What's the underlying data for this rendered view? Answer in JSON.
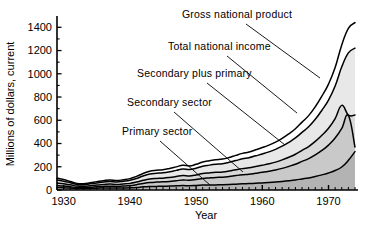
{
  "chart_data": {
    "type": "area",
    "title": "",
    "xlabel": "Year",
    "ylabel": "Millions of dollars, current",
    "xlim": [
      1929,
      1974
    ],
    "ylim": [
      0,
      1480
    ],
    "grid": false,
    "legend_position": "inline-annotations",
    "xticks": [
      "1930",
      "1940",
      "1950",
      "1960",
      "1970"
    ],
    "xtick_values": [
      1930,
      1940,
      1950,
      1960,
      1970
    ],
    "yticks": [
      "0",
      "200",
      "400",
      "600",
      "800",
      "1000",
      "1200",
      "1400"
    ],
    "ytick_values": [
      0,
      200,
      400,
      600,
      800,
      1000,
      1200,
      1400
    ],
    "x": [
      1929,
      1930,
      1931,
      1932,
      1933,
      1934,
      1935,
      1936,
      1937,
      1938,
      1939,
      1940,
      1941,
      1942,
      1943,
      1944,
      1945,
      1946,
      1947,
      1948,
      1949,
      1950,
      1951,
      1952,
      1953,
      1954,
      1955,
      1956,
      1957,
      1958,
      1959,
      1960,
      1961,
      1962,
      1963,
      1964,
      1965,
      1966,
      1967,
      1968,
      1969,
      1970,
      1971,
      1972,
      1973,
      1974
    ],
    "series": [
      {
        "name": "Primary sector",
        "fill": "#b3b3b3",
        "values": [
          22,
          20,
          17,
          13,
          12,
          14,
          16,
          17,
          18,
          17,
          18,
          19,
          22,
          27,
          30,
          31,
          32,
          34,
          36,
          38,
          37,
          39,
          42,
          43,
          44,
          45,
          47,
          50,
          53,
          55,
          58,
          61,
          64,
          68,
          73,
          79,
          86,
          95,
          104,
          116,
          130,
          146,
          168,
          198,
          255,
          330
        ]
      },
      {
        "name": "Secondary sector",
        "fill": "#c9c9c9",
        "values": [
          38,
          34,
          28,
          21,
          20,
          23,
          27,
          30,
          33,
          31,
          34,
          38,
          46,
          56,
          64,
          68,
          70,
          74,
          80,
          86,
          84,
          90,
          99,
          104,
          108,
          110,
          116,
          124,
          131,
          136,
          144,
          152,
          161,
          172,
          186,
          203,
          222,
          246,
          270,
          302,
          341,
          386,
          447,
          530,
          640,
          370
        ]
      },
      {
        "name": "Secondary plus primary",
        "fill": "#d9d9d9",
        "values": [
          60,
          54,
          45,
          34,
          32,
          37,
          43,
          47,
          51,
          48,
          52,
          57,
          68,
          83,
          94,
          99,
          102,
          108,
          116,
          124,
          121,
          129,
          141,
          147,
          152,
          155,
          163,
          174,
          184,
          191,
          202,
          213,
          225,
          240,
          259,
          282,
          308,
          341,
          374,
          418,
          471,
          532,
          615,
          728,
          645,
          645
        ]
      },
      {
        "name": "Total national income",
        "fill": "#e8e8e8",
        "values": [
          85,
          76,
          62,
          48,
          46,
          53,
          61,
          68,
          74,
          69,
          75,
          83,
          99,
          121,
          137,
          144,
          148,
          157,
          169,
          181,
          176,
          188,
          205,
          214,
          221,
          226,
          238,
          253,
          268,
          278,
          294,
          310,
          328,
          350,
          377,
          410,
          448,
          496,
          544,
          608,
          686,
          774,
          895,
          1060,
          1180,
          1220
        ]
      },
      {
        "name": "Gross national product",
        "fill": "#ffffff",
        "values": [
          100,
          90,
          73,
          57,
          54,
          62,
          72,
          80,
          87,
          81,
          88,
          98,
          117,
          142,
          161,
          169,
          174,
          185,
          199,
          213,
          207,
          221,
          241,
          252,
          260,
          266,
          280,
          298,
          315,
          327,
          346,
          365,
          386,
          412,
          444,
          483,
          527,
          584,
          640,
          716,
          808,
          911,
          1054,
          1248,
          1390,
          1440
        ]
      }
    ],
    "annotations": [
      {
        "text": "Gross national product",
        "label_x": 182,
        "label_y": 18,
        "anchor_x": 246,
        "anchor_y": 24,
        "line_to_x": 320,
        "line_to_y": 78
      },
      {
        "text": "Total national income",
        "label_x": 168,
        "label_y": 50,
        "anchor_x": 227,
        "anchor_y": 56,
        "line_to_x": 297,
        "line_to_y": 113
      },
      {
        "text": "Secondary plus primary",
        "label_x": 137,
        "label_y": 77,
        "anchor_x": 207,
        "anchor_y": 83,
        "line_to_x": 285,
        "line_to_y": 145
      },
      {
        "text": "Secondary sector",
        "label_x": 127,
        "label_y": 106,
        "anchor_x": 174,
        "anchor_y": 112,
        "line_to_x": 243,
        "line_to_y": 172
      },
      {
        "text": "Primary sector",
        "label_x": 122,
        "label_y": 135,
        "anchor_x": 160,
        "anchor_y": 141,
        "line_to_x": 210,
        "line_to_y": 185
      }
    ]
  }
}
